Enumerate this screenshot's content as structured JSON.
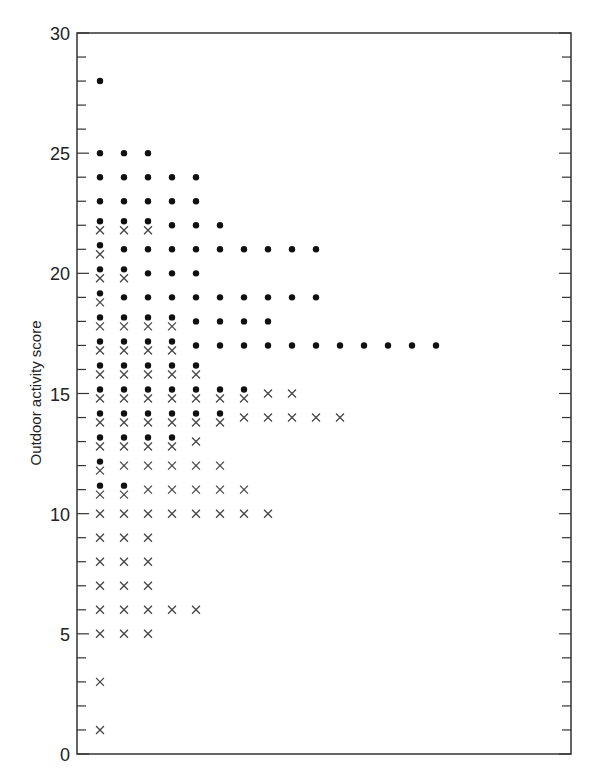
{
  "chart_data": {
    "type": "scatter",
    "title": "",
    "xlabel": "",
    "ylabel": "Outdoor activity score",
    "ylim": [
      0,
      30
    ],
    "yticks_major": [
      0,
      5,
      10,
      15,
      20,
      25,
      30
    ],
    "yticks_minor_step": 1,
    "grid": false,
    "legend": null,
    "layout": "stacked dot plot: each marker is one observation; markers stacked horizontally at each integer score",
    "series": [
      {
        "name": "dot group",
        "marker": "filled-circle",
        "counts_by_score": {
          "28": 1,
          "25": 3,
          "24": 5,
          "23": 5,
          "22": 6,
          "21": 10,
          "20": 5,
          "19": 10,
          "18": 8,
          "17": 15,
          "16": 5,
          "15": 7,
          "14": 6,
          "13": 4,
          "12": 1,
          "11": 2
        }
      },
      {
        "name": "cross group",
        "marker": "x",
        "counts_by_score": {
          "22": 3,
          "21": 1,
          "20": 2,
          "19": 1,
          "18": 4,
          "17": 4,
          "16": 5,
          "15": 9,
          "14": 11,
          "13": 5,
          "12": 6,
          "11": 7,
          "10": 8,
          "9": 3,
          "8": 3,
          "7": 3,
          "6": 5,
          "5": 3,
          "3": 1,
          "1": 1
        }
      }
    ]
  },
  "axis": {
    "y_tick_labels": [
      "0",
      "5",
      "10",
      "15",
      "20",
      "25",
      "30"
    ],
    "y_title": "Outdoor activity score"
  },
  "colors": {
    "marker": "#111111",
    "axis": "#333333",
    "background": "#ffffff"
  }
}
